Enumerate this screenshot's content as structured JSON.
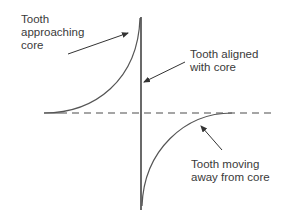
{
  "diagram": {
    "type": "waveform-annotated",
    "labels": {
      "approaching": "Tooth\napproaching\ncore",
      "aligned": "Tooth aligned\nwith core",
      "moving_away": "Tooth moving\naway from core"
    },
    "colors": {
      "line": "#555555",
      "dashed": "#888888",
      "text": "#3a3a3a"
    },
    "elements": {
      "baseline": "dashed horizontal zero line",
      "curve_upper": "rising curve from baseline to peak at alignment",
      "vertical_transition": "sharp vertical transition at alignment",
      "curve_lower": "curve rising from negative peak back to baseline"
    }
  }
}
